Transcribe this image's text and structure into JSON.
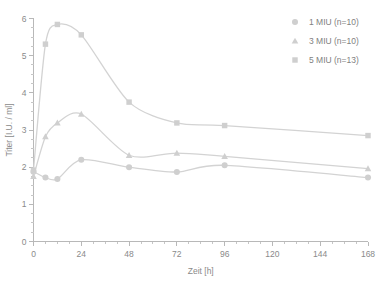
{
  "chart_data": {
    "type": "line",
    "title": "",
    "subtitle": "",
    "xlabel": "Zeit [h]",
    "ylabel": "Titer [I.U. / ml]",
    "xlim": [
      0,
      168
    ],
    "ylim": [
      0,
      6
    ],
    "x_ticks": [
      0,
      24,
      48,
      72,
      96,
      120,
      144,
      168
    ],
    "x_tick_labels": [
      "0",
      "24",
      "48",
      "72",
      "96",
      "120",
      "144",
      "168"
    ],
    "x_minor_step": 6,
    "y_ticks": [
      0,
      1,
      2,
      3,
      4,
      5,
      6
    ],
    "y_tick_labels": [
      "0",
      "1",
      "2",
      "3",
      "4",
      "5",
      "6"
    ],
    "y_minor_step": 0.25,
    "grid": false,
    "legend_position": "top-right",
    "x": [
      0,
      6,
      12,
      24,
      48,
      72,
      96,
      168
    ],
    "series": [
      {
        "name": "1 MIU (n=10)",
        "marker": "circle",
        "color": "#cfcfcf",
        "line_color": "#d3d3d3",
        "values": [
          1.88,
          1.72,
          1.68,
          2.2,
          2.0,
          1.87,
          2.05,
          1.72
        ]
      },
      {
        "name": "3 MIU (n=10)",
        "marker": "triangle",
        "color": "#cfcfcf",
        "line_color": "#d3d3d3",
        "values": [
          1.75,
          2.82,
          3.19,
          3.43,
          2.32,
          2.38,
          2.29,
          1.96
        ]
      },
      {
        "name": "5 MIU (n=13)",
        "marker": "square",
        "color": "#cfcfcf",
        "line_color": "#d3d3d3",
        "values": [
          1.92,
          5.31,
          5.84,
          5.56,
          3.75,
          3.19,
          3.12,
          2.85
        ]
      }
    ]
  },
  "legend": {
    "entries": [
      {
        "label": "1 MIU (n=10)",
        "marker": "circle"
      },
      {
        "label": "3 MIU (n=10)",
        "marker": "triangle"
      },
      {
        "label": "5 MIU (n=13)",
        "marker": "square"
      }
    ]
  },
  "axes": {
    "x_title": "Zeit [h]",
    "y_title": "Titer [I.U. / ml]"
  }
}
